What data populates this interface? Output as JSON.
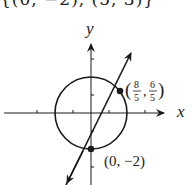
{
  "header": {
    "partial_text": "{(0,  −2), (5, 3)}"
  },
  "figure": {
    "axes": {
      "x_label": "x",
      "y_label": "y"
    },
    "circle": {
      "equation": "x^2 + y^2 = 4",
      "center": [
        0,
        0
      ],
      "radius": 2
    },
    "line": {
      "equation": "y = 2x − 2"
    },
    "points": [
      {
        "label_open": "(",
        "num1": "8",
        "den1": "5",
        "sep": ",",
        "num2": "6",
        "den2": "5",
        "label_close": ")",
        "x": 1.6,
        "y": 1.2
      },
      {
        "label": "(0, −2)",
        "x": 0,
        "y": -2
      }
    ],
    "colors": {
      "stroke": "#1a1a1a"
    }
  }
}
